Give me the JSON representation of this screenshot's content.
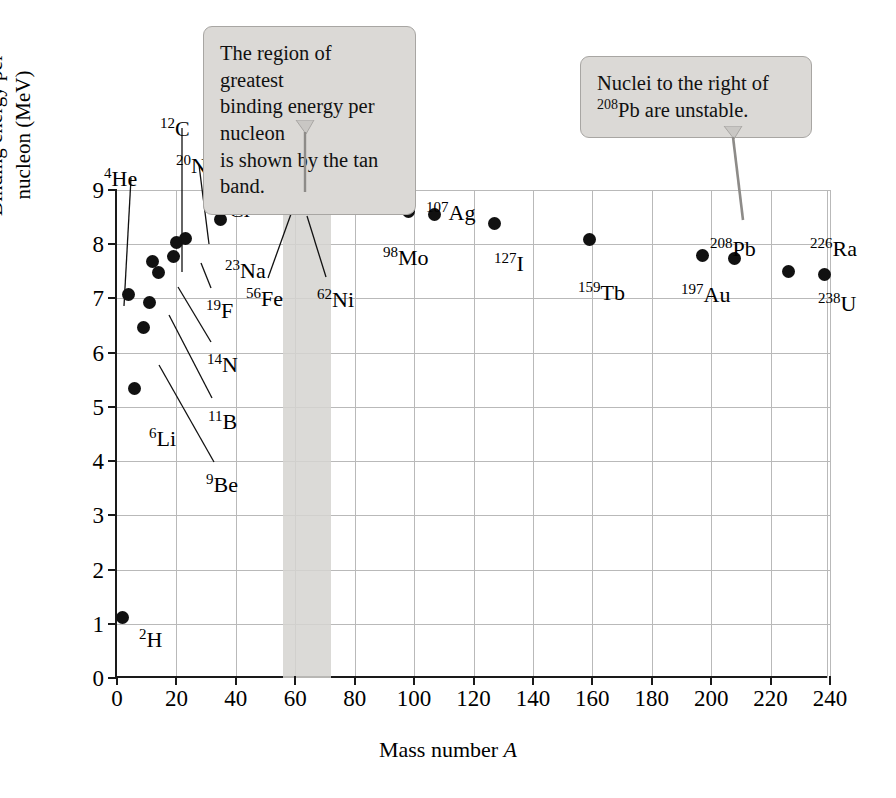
{
  "chart_data": {
    "type": "scatter",
    "title": "",
    "xlabel": "Mass number A",
    "ylabel": "Binding energy per nucleon (MeV)",
    "xlim": [
      0,
      240
    ],
    "ylim": [
      0,
      9
    ],
    "grid": true,
    "legend": "none",
    "xticks": [
      "0",
      "20",
      "40",
      "60",
      "80",
      "100",
      "120",
      "140",
      "160",
      "180",
      "200",
      "220",
      "240"
    ],
    "yticks": [
      "0",
      "1",
      "2",
      "3",
      "4",
      "5",
      "6",
      "7",
      "8",
      "9"
    ],
    "points": [
      {
        "label": "H",
        "mass": 2,
        "superscript": "2",
        "x": 2,
        "y": 1.12,
        "lab_x": 139,
        "lab_y": 629,
        "leader": false
      },
      {
        "label": "He",
        "mass": 4,
        "superscript": "4",
        "x": 4,
        "y": 7.07,
        "lab_x": 104,
        "lab_y": 168,
        "leader": true,
        "lx1": 131,
        "ly1": 178,
        "lx2": 124,
        "ly2": 306
      },
      {
        "label": "Li",
        "mass": 6,
        "superscript": "6",
        "x": 6,
        "y": 5.33,
        "lab_x": 149,
        "lab_y": 428,
        "leader": false
      },
      {
        "label": "Be",
        "mass": 9,
        "superscript": "9",
        "x": 9,
        "y": 6.46,
        "lab_x": 206,
        "lab_y": 474,
        "leader": true,
        "lx1": 214,
        "ly1": 462,
        "lx2": 159,
        "ly2": 365
      },
      {
        "label": "B",
        "mass": 11,
        "superscript": "11",
        "x": 11,
        "y": 6.93,
        "lab_x": 208,
        "lab_y": 411,
        "leader": true,
        "lx1": 212,
        "ly1": 398,
        "lx2": 169,
        "ly2": 315
      },
      {
        "label": "C",
        "mass": 12,
        "superscript": "12",
        "x": 12,
        "y": 7.68,
        "lab_x": 160,
        "lab_y": 118,
        "leader": true,
        "lx1": 182,
        "ly1": 128,
        "lx2": 182,
        "ly2": 272
      },
      {
        "label": "N",
        "mass": 14,
        "superscript": "14",
        "x": 14,
        "y": 7.48,
        "lab_x": 207,
        "lab_y": 354,
        "leader": true,
        "lx1": 211,
        "ly1": 342,
        "lx2": 178,
        "ly2": 287
      },
      {
        "label": "F",
        "mass": 19,
        "superscript": "19",
        "x": 19,
        "y": 7.78,
        "lab_x": 206,
        "lab_y": 300,
        "leader": true,
        "lx1": 211,
        "ly1": 288,
        "lx2": 201,
        "ly2": 263
      },
      {
        "label": "Ne",
        "mass": 20,
        "superscript": "20",
        "x": 20,
        "y": 8.03,
        "lab_x": 176,
        "lab_y": 155,
        "leader": true,
        "lx1": 199,
        "ly1": 165,
        "lx2": 209,
        "ly2": 244
      },
      {
        "label": "Na",
        "mass": 23,
        "superscript": "23",
        "x": 23,
        "y": 8.11,
        "lab_x": 225,
        "lab_y": 260,
        "leader": false
      },
      {
        "label": "Cl",
        "mass": 35,
        "superscript": "35",
        "x": 35,
        "y": 8.45,
        "lab_x": 214,
        "lab_y": 199,
        "leader": false
      },
      {
        "label": "Fe",
        "mass": 56,
        "superscript": "56",
        "x": 56,
        "y": 8.72,
        "lab_x": 246,
        "lab_y": 288,
        "leader": true,
        "lx1": 268,
        "ly1": 278,
        "lx2": 291,
        "ly2": 214
      },
      {
        "label": "Ni",
        "mass": 62,
        "superscript": "62",
        "x": 62,
        "y": 8.73,
        "lab_x": 317,
        "lab_y": 289,
        "leader": true,
        "lx1": 326,
        "ly1": 277,
        "lx2": 307,
        "ly2": 216
      },
      {
        "label": "Ge",
        "mass": 72,
        "superscript": "72",
        "x": 72,
        "y": 8.68,
        "lab_x": 326,
        "lab_y": 190,
        "leader": false
      },
      {
        "label": "Mo",
        "mass": 98,
        "superscript": "98",
        "x": 98,
        "y": 8.6,
        "lab_x": 383,
        "lab_y": 247,
        "leader": false
      },
      {
        "label": "Ag",
        "mass": 107,
        "superscript": "107",
        "x": 107,
        "y": 8.55,
        "lab_x": 426,
        "lab_y": 202,
        "leader": false
      },
      {
        "label": "I",
        "mass": 127,
        "superscript": "127",
        "x": 127,
        "y": 8.38,
        "lab_x": 494,
        "lab_y": 253,
        "leader": false
      },
      {
        "label": "Tb",
        "mass": 159,
        "superscript": "159",
        "x": 159,
        "y": 8.08,
        "lab_x": 578,
        "lab_y": 282,
        "leader": false
      },
      {
        "label": "Au",
        "mass": 197,
        "superscript": "197",
        "x": 197,
        "y": 7.8,
        "lab_x": 681,
        "lab_y": 284,
        "leader": false
      },
      {
        "label": "Pb",
        "mass": 208,
        "superscript": "208",
        "x": 208,
        "y": 7.73,
        "lab_x": 710,
        "lab_y": 238,
        "leader": false
      },
      {
        "label": "Ra",
        "mass": 226,
        "superscript": "226",
        "x": 226,
        "y": 7.5,
        "lab_x": 810,
        "lab_y": 238,
        "leader": false
      },
      {
        "label": "U",
        "mass": 238,
        "superscript": "238",
        "x": 238,
        "y": 7.45,
        "lab_x": 818,
        "lab_y": 293,
        "leader": false
      }
    ],
    "band": {
      "name": "tan-band",
      "x_start": 56,
      "x_end": 72,
      "color": "#d5d3d0",
      "description": "region of greatest binding energy per nucleon"
    },
    "annotations": [
      {
        "name": "callout-tan-band",
        "lines": [
          "The region of greatest",
          "binding energy per nucleon",
          "is shown by the tan band."
        ],
        "points_to": "tan-band"
      },
      {
        "name": "callout-unstable-nuclei",
        "lines": [
          "Nuclei to the right of",
          "<sup>208</sup>Pb are unstable."
        ],
        "points_to": "Pb"
      }
    ]
  },
  "callouts": {
    "band_note": {
      "line1": "The region of greatest",
      "line2": "binding energy per nucleon",
      "line3": "is shown by the tan band."
    },
    "stability_note": {
      "line1": "Nuclei to the right of",
      "line2_sup": "208",
      "line2_rest": "Pb are unstable."
    }
  },
  "axes": {
    "x_title_text": "Mass number ",
    "x_title_italic": "A",
    "y_title_line1": "Binding energy per",
    "y_title_line2": "nucleon (MeV)"
  }
}
